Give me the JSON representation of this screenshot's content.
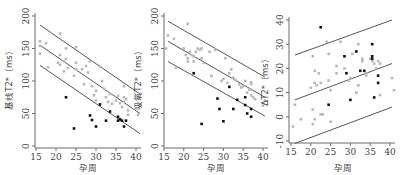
{
  "chart_data": [
    {
      "type": "scatter",
      "title": "",
      "xlabel": "孕周",
      "ylabel": "基线T2*（ms）",
      "xlim": [
        15,
        41
      ],
      "ylim": [
        0,
        200
      ],
      "xticks": [
        15,
        20,
        25,
        30,
        35,
        40
      ],
      "yticks": [
        0,
        50,
        100,
        150,
        200
      ],
      "grid": false,
      "regression_lines": [
        {
          "name": "upper",
          "x": [
            16,
            41
          ],
          "y": [
            186,
            80
          ]
        },
        {
          "name": "fit",
          "x": [
            16,
            41
          ],
          "y": [
            155,
            50
          ]
        },
        {
          "name": "lower",
          "x": [
            16,
            41
          ],
          "y": [
            124,
            19
          ]
        }
      ],
      "series": [
        {
          "name": "normal",
          "color": "#b8b8b8",
          "points": [
            [
              16,
              161
            ],
            [
              16,
              142
            ],
            [
              16,
              154
            ],
            [
              17.5,
              158
            ],
            [
              18,
              121
            ],
            [
              21,
              173
            ],
            [
              21,
              140
            ],
            [
              20.5,
              128
            ],
            [
              21,
              125
            ],
            [
              22,
              130
            ],
            [
              22.5,
              150
            ],
            [
              22.5,
              134
            ],
            [
              22,
              115
            ],
            [
              23,
              120
            ],
            [
              24.5,
              108
            ],
            [
              25,
              152
            ],
            [
              25,
              128
            ],
            [
              25,
              118
            ],
            [
              26.5,
              118
            ],
            [
              27.5,
              123
            ],
            [
              28,
              113
            ],
            [
              28.5,
              130
            ],
            [
              27,
              95
            ],
            [
              29,
              92
            ],
            [
              30,
              85
            ],
            [
              29.5,
              78
            ],
            [
              30,
              70
            ],
            [
              31,
              122
            ],
            [
              31.5,
              100
            ],
            [
              32,
              88
            ],
            [
              32.5,
              75
            ],
            [
              33,
              68
            ],
            [
              33.5,
              80
            ],
            [
              34,
              65
            ],
            [
              35,
              70
            ],
            [
              35.5,
              77
            ],
            [
              36,
              66
            ],
            [
              36.5,
              60
            ],
            [
              37,
              92
            ],
            [
              37,
              75
            ],
            [
              37,
              68
            ],
            [
              37.5,
              72
            ],
            [
              38,
              55
            ],
            [
              38,
              48
            ],
            [
              40.5,
              48
            ],
            [
              41,
              62
            ]
          ]
        },
        {
          "name": "abnormal",
          "color": "#111111",
          "points": [
            [
              22.5,
              75
            ],
            [
              24.5,
              27
            ],
            [
              28.5,
              47
            ],
            [
              29,
              40
            ],
            [
              30,
              30
            ],
            [
              31,
              64
            ],
            [
              32.5,
              39
            ],
            [
              33.5,
              53
            ],
            [
              35.5,
              45
            ],
            [
              35.5,
              39
            ],
            [
              36,
              41
            ],
            [
              36.5,
              39
            ],
            [
              37,
              30
            ],
            [
              37.5,
              39
            ]
          ]
        }
      ]
    },
    {
      "type": "scatter",
      "title": "",
      "xlabel": "孕周",
      "ylabel": "吸氧T2*（ms）",
      "xlim": [
        15,
        41
      ],
      "ylim": [
        0,
        200
      ],
      "xticks": [
        15,
        20,
        25,
        30,
        35,
        40
      ],
      "yticks": [
        0,
        50,
        100,
        150,
        200
      ],
      "grid": false,
      "regression_lines": [
        {
          "name": "upper",
          "x": [
            16,
            40.5
          ],
          "y": [
            192,
            106
          ]
        },
        {
          "name": "fit",
          "x": [
            16,
            40.5
          ],
          "y": [
            161,
            75
          ]
        },
        {
          "name": "lower",
          "x": [
            16,
            40.5
          ],
          "y": [
            130,
            46
          ]
        }
      ],
      "series": [
        {
          "name": "normal",
          "color": "#b8b8b8",
          "points": [
            [
              15.5,
              150
            ],
            [
              16,
              170
            ],
            [
              17.5,
              165
            ],
            [
              18,
              120
            ],
            [
              20,
              150
            ],
            [
              20.5,
              140
            ],
            [
              21,
              135
            ],
            [
              21,
              188
            ],
            [
              21,
              130
            ],
            [
              21.5,
              145
            ],
            [
              22,
              140
            ],
            [
              22.5,
              130
            ],
            [
              22.5,
              138
            ],
            [
              23,
              145
            ],
            [
              23.5,
              150
            ],
            [
              24,
              148
            ],
            [
              24.5,
              150
            ],
            [
              24.5,
              135
            ],
            [
              25,
              128
            ],
            [
              26.5,
              145
            ],
            [
              27,
              108
            ],
            [
              28,
              148
            ],
            [
              29.5,
              100
            ],
            [
              30,
              103
            ],
            [
              30.5,
              135
            ],
            [
              31,
              97
            ],
            [
              31.5,
              112
            ],
            [
              32,
              118
            ],
            [
              32.5,
              105
            ],
            [
              33,
              102
            ],
            [
              34,
              95
            ],
            [
              34.5,
              90
            ],
            [
              35,
              92
            ],
            [
              35.5,
              100
            ],
            [
              36,
              82
            ],
            [
              36.5,
              87
            ],
            [
              37,
              98
            ],
            [
              37,
              95
            ],
            [
              37,
              87
            ],
            [
              37,
              78
            ],
            [
              37.5,
              75
            ],
            [
              38,
              72
            ],
            [
              40,
              62
            ],
            [
              40.5,
              70
            ]
          ]
        },
        {
          "name": "abnormal",
          "color": "#111111",
          "points": [
            [
              22.5,
              112
            ],
            [
              24.5,
              34
            ],
            [
              28.5,
              73
            ],
            [
              29,
              57
            ],
            [
              30,
              38
            ],
            [
              31.5,
              91
            ],
            [
              32.5,
              57
            ],
            [
              33.5,
              71
            ],
            [
              35.5,
              63
            ],
            [
              35.5,
              75
            ],
            [
              36,
              50
            ],
            [
              37,
              57
            ],
            [
              37,
              45
            ]
          ]
        }
      ]
    },
    {
      "type": "scatter",
      "title": "",
      "xlabel": "孕周",
      "ylabel": "ΔT2*（ms）",
      "xlim": [
        15,
        41
      ],
      "ylim": [
        -12,
        42
      ],
      "xticks": [
        15,
        20,
        25,
        30,
        35,
        40
      ],
      "yticks": [
        -10,
        0,
        10,
        20,
        30,
        40
      ],
      "grid": false,
      "regression_lines": [
        {
          "name": "upper",
          "x": [
            16,
            40.5
          ],
          "y": [
            25.5,
            40
          ]
        },
        {
          "name": "fit",
          "x": [
            16,
            40.5
          ],
          "y": [
            7,
            22
          ]
        },
        {
          "name": "lower",
          "x": [
            16,
            40.5
          ],
          "y": [
            -11,
            4
          ]
        }
      ],
      "series": [
        {
          "name": "normal",
          "color": "#b8b8b8",
          "points": [
            [
              15.5,
              -4
            ],
            [
              16,
              5
            ],
            [
              17.5,
              -1
            ],
            [
              20,
              12
            ],
            [
              20.5,
              25
            ],
            [
              20.5,
              3
            ],
            [
              20.5,
              -3
            ],
            [
              21,
              19
            ],
            [
              21,
              14
            ],
            [
              21,
              -1
            ],
            [
              21.5,
              13
            ],
            [
              22,
              18
            ],
            [
              22.5,
              14
            ],
            [
              22.5,
              1
            ],
            [
              23,
              1
            ],
            [
              24,
              31
            ],
            [
              24.5,
              26
            ],
            [
              24.5,
              15
            ],
            [
              25,
              11
            ],
            [
              25,
              -2
            ],
            [
              26.5,
              21
            ],
            [
              26.5,
              18
            ],
            [
              27.5,
              31
            ],
            [
              28.5,
              20
            ],
            [
              29.5,
              15
            ],
            [
              30,
              16
            ],
            [
              30.5,
              26
            ],
            [
              31.5,
              10
            ],
            [
              32,
              30
            ],
            [
              32,
              13
            ],
            [
              33,
              24
            ],
            [
              33,
              23
            ],
            [
              34,
              18
            ],
            [
              34,
              17
            ],
            [
              35,
              24
            ],
            [
              35.5,
              23
            ],
            [
              36,
              22
            ],
            [
              36.5,
              20
            ],
            [
              37,
              23
            ],
            [
              37.5,
              22
            ],
            [
              37.5,
              9
            ],
            [
              40.5,
              16
            ],
            [
              41,
              11
            ]
          ]
        },
        {
          "name": "abnormal",
          "color": "#111111",
          "points": [
            [
              22.5,
              37
            ],
            [
              24.5,
              5
            ],
            [
              28.5,
              25
            ],
            [
              29,
              18
            ],
            [
              30,
              7
            ],
            [
              31.5,
              27
            ],
            [
              32.5,
              19
            ],
            [
              33.5,
              19
            ],
            [
              35.5,
              24
            ],
            [
              35.5,
              30
            ],
            [
              35.5,
              25
            ],
            [
              36,
              8
            ],
            [
              37,
              17
            ],
            [
              37,
              14
            ]
          ]
        }
      ]
    }
  ],
  "panels": [
    {
      "ylabel": "基线T2*（ms）",
      "xlabel": "孕周"
    },
    {
      "ylabel": "吸氧T2*（ms）",
      "xlabel": "孕周"
    },
    {
      "ylabel": "ΔT2*（ms）",
      "xlabel": "孕周"
    }
  ]
}
